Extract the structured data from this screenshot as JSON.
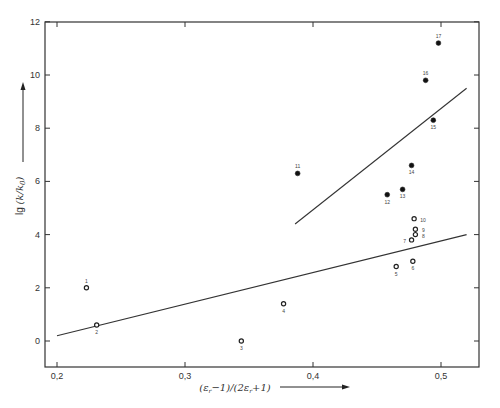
{
  "chart_data": {
    "type": "scatter",
    "title": "",
    "xlabel": "(ε_r − 1)/(2ε_r + 1)",
    "ylabel": "lg (k/k₀)",
    "xlim": [
      0.19,
      0.53
    ],
    "ylim": [
      -1,
      12
    ],
    "x_ticks": [
      0.2,
      0.3,
      0.4,
      0.5
    ],
    "x_tick_labels": [
      "0,2",
      "0,3",
      "0,4",
      "0,5"
    ],
    "y_ticks": [
      0,
      2,
      4,
      6,
      8,
      10,
      12
    ],
    "y_tick_labels": [
      "0",
      "2",
      "4",
      "6",
      "8",
      "10",
      "12"
    ],
    "grid": false,
    "legend": null,
    "series": [
      {
        "name": "open circles",
        "marker": "open-circle",
        "points": [
          {
            "label": "1",
            "x": 0.223,
            "y": 2.0
          },
          {
            "label": "2",
            "x": 0.231,
            "y": 0.6
          },
          {
            "label": "3",
            "x": 0.344,
            "y": 0.0
          },
          {
            "label": "4",
            "x": 0.377,
            "y": 1.4
          },
          {
            "label": "5",
            "x": 0.465,
            "y": 2.8
          },
          {
            "label": "6",
            "x": 0.478,
            "y": 3.0
          },
          {
            "label": "7",
            "x": 0.477,
            "y": 3.8
          },
          {
            "label": "8",
            "x": 0.48,
            "y": 4.0
          },
          {
            "label": "9",
            "x": 0.48,
            "y": 4.2
          },
          {
            "label": "10",
            "x": 0.479,
            "y": 4.6
          }
        ]
      },
      {
        "name": "filled circles",
        "marker": "filled-circle",
        "points": [
          {
            "label": "11",
            "x": 0.388,
            "y": 6.3
          },
          {
            "label": "12",
            "x": 0.458,
            "y": 5.5
          },
          {
            "label": "13",
            "x": 0.47,
            "y": 5.7
          },
          {
            "label": "14",
            "x": 0.477,
            "y": 6.6
          },
          {
            "label": "15",
            "x": 0.494,
            "y": 8.3
          },
          {
            "label": "16",
            "x": 0.488,
            "y": 9.8
          },
          {
            "label": "17",
            "x": 0.498,
            "y": 11.2
          }
        ]
      }
    ],
    "fit_lines": [
      {
        "name": "lower regression line",
        "x": [
          0.2,
          0.52
        ],
        "y": [
          0.2,
          4.0
        ]
      },
      {
        "name": "upper regression line",
        "x": [
          0.386,
          0.52
        ],
        "y": [
          4.4,
          9.5
        ]
      }
    ]
  },
  "labels": {
    "ylabel_prefix": "lg",
    "ylabel_body": "(k/k",
    "ylabel_sub": "0",
    "ylabel_close": ")",
    "xlabel": "(ε",
    "xlabel_full": "(εr −1)/(2εr +1)"
  }
}
